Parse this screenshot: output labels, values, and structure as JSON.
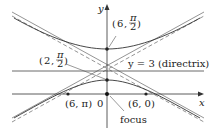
{
  "diagram": {
    "type": "conic_polar_hyperbola",
    "axes": {
      "x_label": "x",
      "y_label": "y",
      "origin_label": "0"
    },
    "directrix": {
      "label": "y = 3 (directrix)"
    },
    "points": [
      {
        "id": "vertex-upper",
        "label_r": "6",
        "label_theta": "π/2",
        "label": "(6, π/2)"
      },
      {
        "id": "vertex-lower",
        "label_r": "2",
        "label_theta": "π/2",
        "label": "(2, π/2)"
      },
      {
        "id": "x-intercept-left",
        "label": "(6, π)"
      },
      {
        "id": "x-intercept-right",
        "label": "(6, 0)"
      },
      {
        "id": "focus",
        "label": "focus"
      }
    ],
    "fraction": {
      "numerator": "π",
      "denominator": "2"
    },
    "colors": {
      "curve": "#333333",
      "axes": "#333333",
      "asymptote": "#555555",
      "text": "#222222",
      "background": "#ffffff"
    }
  }
}
